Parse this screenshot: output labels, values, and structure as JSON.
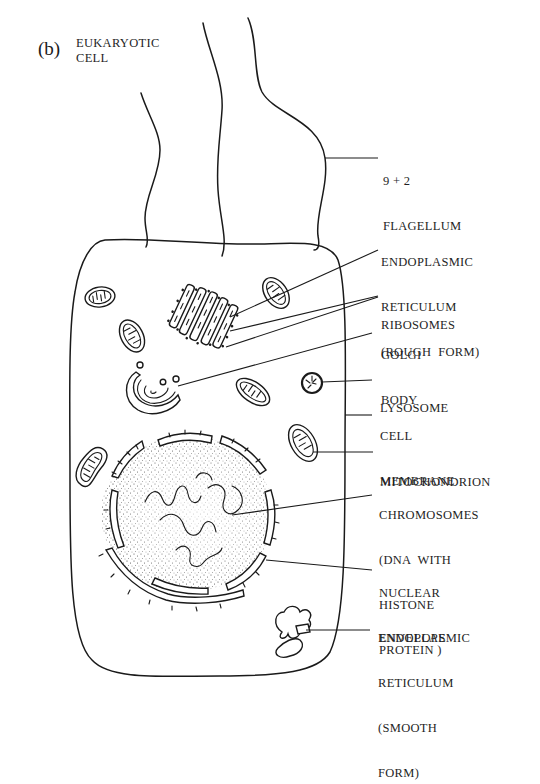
{
  "figure": {
    "panel_label": "(b)",
    "title_lines": [
      "EUKARYOTIC",
      "CELL"
    ],
    "ink_color": "#1a1a1a",
    "background_color": "#ffffff"
  },
  "labels": [
    {
      "id": "flagellum",
      "lines": [
        "9 + 2",
        "FLAGELLUM"
      ]
    },
    {
      "id": "er-rough",
      "lines": [
        "ENDOPLASMIC",
        "RETICULUM",
        "(ROUGH  FORM)"
      ]
    },
    {
      "id": "ribosomes",
      "lines": [
        "RIBOSOMES"
      ]
    },
    {
      "id": "golgi",
      "lines": [
        "GOLGI",
        "BODY"
      ]
    },
    {
      "id": "lysosome",
      "lines": [
        "LYSOSOME"
      ]
    },
    {
      "id": "cell-membrane",
      "lines": [
        "CELL",
        "MEMBRANE"
      ]
    },
    {
      "id": "mitochondrion",
      "lines": [
        "MITOCHONDRION"
      ]
    },
    {
      "id": "chromosomes",
      "lines": [
        "CHROMOSOMES",
        "(DNA  WITH",
        "HISTONE",
        "PROTEIN )"
      ]
    },
    {
      "id": "nuclear-envelope",
      "lines": [
        "NUCLEAR",
        "ENVELOPE"
      ]
    },
    {
      "id": "er-smooth",
      "lines": [
        "ENDOPLASMIC",
        "RETICULUM",
        "(SMOOTH",
        "FORM)"
      ]
    }
  ]
}
